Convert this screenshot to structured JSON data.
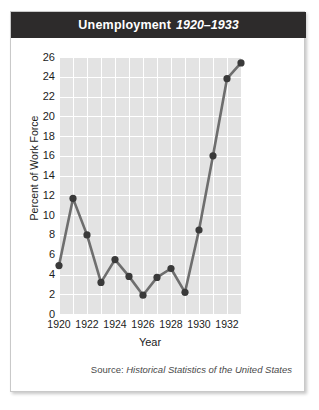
{
  "figure": {
    "title_main": "Unemployment",
    "title_range": "1920–1933",
    "source_prefix": "Source:",
    "source_work": "Historical Statistics of the United States"
  },
  "colors": {
    "title_bar": "#2d2b2b",
    "plot_background": "#e3e3e3",
    "gridline": "#ffffff",
    "series_line": "#6e6e6e",
    "series_marker": "#3a3a3a",
    "card_border": "#c9c9c9",
    "page_background": "#ffffff",
    "text": "#1c1c1c"
  },
  "chart_data": {
    "type": "line",
    "title": "Unemployment 1920–1933",
    "xlabel": "Year",
    "ylabel": "Percent of Work Force",
    "xlim": [
      1920,
      1933
    ],
    "ylim": [
      0,
      26
    ],
    "ytick_step": 2,
    "xtick_step": 2,
    "grid": true,
    "legend": "none",
    "markers": true,
    "yticks": [
      0,
      2,
      4,
      6,
      8,
      10,
      12,
      14,
      16,
      18,
      20,
      22,
      24,
      26
    ],
    "xticks": [
      1920,
      1922,
      1924,
      1926,
      1928,
      1930,
      1932
    ],
    "x": [
      1920,
      1921,
      1922,
      1923,
      1924,
      1925,
      1926,
      1927,
      1928,
      1929,
      1930,
      1931,
      1932,
      1933
    ],
    "values": [
      4.9,
      11.7,
      8.0,
      3.2,
      5.5,
      3.8,
      1.9,
      3.7,
      4.6,
      2.2,
      8.5,
      16.0,
      23.8,
      25.4
    ],
    "series": [
      {
        "name": "Percent of Work Force",
        "values": [
          4.9,
          11.7,
          8.0,
          3.2,
          5.5,
          3.8,
          1.9,
          3.7,
          4.6,
          2.2,
          8.5,
          16.0,
          23.8,
          25.4
        ]
      }
    ]
  }
}
